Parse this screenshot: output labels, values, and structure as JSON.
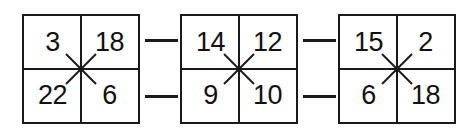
{
  "figure": {
    "type": "cross-multiplication-grid-chain",
    "title": "",
    "colors": {
      "line": "#1a1a1a",
      "text": "#111111",
      "background": "#ffffff"
    },
    "boxes": [
      {
        "id": "box-1",
        "cells": {
          "top_left": "3",
          "top_right": "18",
          "bottom_left": "22",
          "bottom_right": "6"
        },
        "center_mark": "x-cross-mark"
      },
      {
        "id": "box-2",
        "cells": {
          "top_left": "14",
          "top_right": "12",
          "bottom_left": "9",
          "bottom_right": "10"
        },
        "center_mark": "x-cross-mark"
      },
      {
        "id": "box-3",
        "cells": {
          "top_left": "15",
          "top_right": "2",
          "bottom_left": "6",
          "bottom_right": "18"
        },
        "center_mark": "x-cross-mark"
      }
    ],
    "connectors": [
      {
        "id": "gap-1-top",
        "row": "top",
        "between": "box-1 to box-2"
      },
      {
        "id": "gap-1-bottom",
        "row": "bottom",
        "between": "box-1 to box-2"
      },
      {
        "id": "gap-2-top",
        "row": "top",
        "between": "box-2 to box-3"
      },
      {
        "id": "gap-2-bottom",
        "row": "bottom",
        "between": "box-2 to box-3"
      }
    ]
  }
}
